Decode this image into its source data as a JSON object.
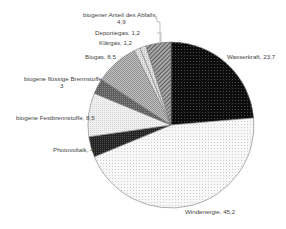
{
  "chart_data": {
    "type": "pie",
    "title": "",
    "start_angle_deg": 0,
    "direction": "clockwise",
    "center": [
      171,
      125
    ],
    "radius": 83,
    "slices": [
      {
        "label": "Wasserkraft",
        "value": 23.7,
        "fill": "#111111",
        "pattern": "dots-dark",
        "label_text": "Wasserkraft, 23,7"
      },
      {
        "label": "Windenergie",
        "value": 45.2,
        "fill": "#f4f4f4",
        "pattern": "dots-light",
        "label_text": "Windenergie, 45,2"
      },
      {
        "label": "Photovoltaik",
        "value": 4,
        "fill": "#2a2a2a",
        "pattern": "dense-dark",
        "label_text": "Photovoltaik, 4"
      },
      {
        "label": "biogene Festbrennstoffe",
        "value": 8.5,
        "fill": "#ececec",
        "pattern": "light-grid",
        "label_text": "biogene Festbrennstoffe, 8,5"
      },
      {
        "label": "biogene flüssige Brennstoffe",
        "value": 3,
        "fill": "#6a6a6a",
        "pattern": "mid-grey",
        "label_text": "biogene flüssige Brennstoffe, 3"
      },
      {
        "label": "Biogas",
        "value": 8.5,
        "fill": "#b4b4b4",
        "pattern": "checker",
        "label_text": "Biogas, 8,5"
      },
      {
        "label": "Klärgas",
        "value": 1.2,
        "fill": "#dcdcdc",
        "pattern": "light",
        "label_text": "Klärgas, 1,2"
      },
      {
        "label": "Deponiegas",
        "value": 1.2,
        "fill": "#c8c8c8",
        "pattern": "light",
        "label_text": "Deponiegas, 1,2"
      },
      {
        "label": "biogener Anteil des Abfalls",
        "value": 4.9,
        "fill": "#8c8c8c",
        "pattern": "diagonal",
        "label_text": "biogener Anteil des Abfalls, 4,9"
      }
    ],
    "legend": "none (data labels with leader lines)",
    "number_format": "decimal comma"
  },
  "labels": {
    "wasserkraft": "Wasserkraft, 23,7",
    "windenergie": "Windenergie, 45,2",
    "photovoltaik": "Photovoltaik, 4",
    "fest": "biogene Festbrennstoffe, 8,5",
    "fluessig_1": "biogene flüssige Brennstoffe,",
    "fluessig_2": "3",
    "biogas": "Biogas, 8,5",
    "klaergas": "Klärgas, 1,2",
    "deponiegas": "Deponiegas, 1,2",
    "abfall_1": "biogener Anteil des Abfalls,",
    "abfall_2": "4,9"
  }
}
